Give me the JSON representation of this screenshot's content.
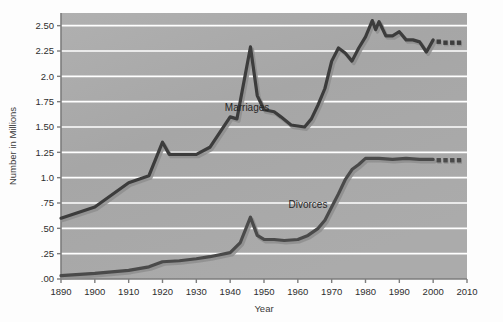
{
  "figure": {
    "background_color": "#fdfdfd",
    "plot_background_color": "#a8a8a8",
    "gridline_color": "#ffffff",
    "axis_color": "#6d6d6d",
    "marriages_color": "#3c3c3c",
    "divorces_color": "#4a4a4a",
    "shadow_color": "#8e8e8e"
  },
  "chart_data": {
    "type": "line",
    "title": "",
    "xlabel": "Year",
    "ylabel": "Number in Millions",
    "xlim": [
      1890,
      2010
    ],
    "ylim": [
      0.0,
      2.625
    ],
    "grid": true,
    "legend_position": "inline-annotations",
    "xticks": [
      1890,
      1900,
      1910,
      1920,
      1930,
      1940,
      1950,
      1960,
      1970,
      1980,
      1990,
      2000,
      2010
    ],
    "xticklabels": [
      "1890",
      "1900",
      "1910",
      "1920",
      "1930",
      "1940",
      "1950",
      "1960",
      "1970",
      "1980",
      "1990",
      "2000",
      "2010"
    ],
    "yticks": [
      0.0,
      0.25,
      0.5,
      0.75,
      1.0,
      1.25,
      1.5,
      1.75,
      2.0,
      2.25,
      2.5
    ],
    "yticklabels": [
      ".00",
      ".25",
      ".50",
      ".75",
      "1.0",
      "1.25",
      "1.50",
      "1.75",
      "2.0",
      "2.25",
      "2.50"
    ],
    "annotations": [
      {
        "text": "Marriages",
        "x": 1945,
        "y": 1.66
      },
      {
        "text": "Divorces",
        "x": 1963,
        "y": 0.7
      }
    ],
    "series": [
      {
        "name": "Marriages",
        "color": "#3c3c3c",
        "solid_x": [
          1890,
          1900,
          1910,
          1916,
          1920,
          1922,
          1930,
          1934,
          1940,
          1942,
          1946,
          1948,
          1950,
          1953,
          1955,
          1958,
          1962,
          1964,
          1966,
          1968,
          1970,
          1972,
          1974,
          1976,
          1978,
          1980,
          1982,
          1983,
          1984,
          1986,
          1988,
          1990,
          1992,
          1994,
          1996,
          1998,
          2000
        ],
        "solid_y": [
          0.6,
          0.71,
          0.95,
          1.02,
          1.35,
          1.23,
          1.23,
          1.3,
          1.6,
          1.58,
          2.29,
          1.81,
          1.67,
          1.65,
          1.6,
          1.52,
          1.5,
          1.58,
          1.72,
          1.88,
          2.15,
          2.28,
          2.23,
          2.15,
          2.28,
          2.39,
          2.55,
          2.46,
          2.54,
          2.4,
          2.4,
          2.44,
          2.36,
          2.36,
          2.34,
          2.24,
          2.36
        ],
        "dashed_x": [
          2000,
          2002,
          2004,
          2006,
          2008
        ],
        "dashed_y": [
          2.36,
          2.34,
          2.33,
          2.33,
          2.33
        ]
      },
      {
        "name": "Divorces",
        "color": "#4a4a4a",
        "solid_x": [
          1890,
          1900,
          1905,
          1910,
          1916,
          1920,
          1925,
          1930,
          1934,
          1940,
          1943,
          1946,
          1948,
          1950,
          1953,
          1956,
          1960,
          1963,
          1966,
          1968,
          1970,
          1972,
          1974,
          1976,
          1978,
          1980,
          1984,
          1988,
          1992,
          1996,
          2000
        ],
        "solid_y": [
          0.033,
          0.055,
          0.07,
          0.085,
          0.12,
          0.17,
          0.18,
          0.2,
          0.22,
          0.26,
          0.36,
          0.61,
          0.43,
          0.39,
          0.39,
          0.38,
          0.39,
          0.43,
          0.5,
          0.58,
          0.71,
          0.84,
          0.98,
          1.08,
          1.13,
          1.19,
          1.19,
          1.18,
          1.19,
          1.18,
          1.18
        ],
        "dashed_x": [
          2000,
          2002,
          2004,
          2006,
          2008
        ],
        "dashed_y": [
          1.18,
          1.17,
          1.17,
          1.17,
          1.17
        ]
      }
    ]
  }
}
